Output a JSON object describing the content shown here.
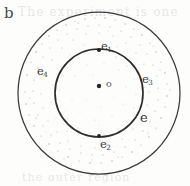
{
  "figure": {
    "panel_letter": "b",
    "caption_ghost_top": "The experiment is one",
    "caption_ghost_bottom": "the outer region",
    "background_color": "#fdfdfc",
    "ink_color": "#3b3b3b",
    "stipple_color": "#8a8a8a"
  },
  "geometry": {
    "center": {
      "x": 99,
      "y": 93
    },
    "outer_circle": {
      "cx": 99,
      "cy": 93,
      "r": 81,
      "label": "outer-circle"
    },
    "inner_circle": {
      "cx": 99,
      "cy": 93,
      "r": 44,
      "label": "inner-circle"
    },
    "axis_line": {
      "x": 99,
      "y1": 12,
      "y2": 174,
      "label": "vertical-axis"
    },
    "dashed_lines": [
      {
        "y": 76,
        "x1": 62,
        "x2": 136,
        "label": "dashed-upper"
      },
      {
        "y": 86,
        "x1": 57,
        "x2": 141,
        "label": "dashed-middle"
      },
      {
        "y": 93,
        "x1": 55,
        "x2": 143,
        "label": "dashed-equator"
      }
    ]
  },
  "labels": {
    "e1": {
      "text": "e",
      "sub": "1",
      "role": "north-pole-point"
    },
    "e2": {
      "text": "e",
      "sub": "2",
      "role": "south-pole-point"
    },
    "e3": {
      "text": "e",
      "sub": "3",
      "role": "east-point"
    },
    "e4": {
      "text": "e",
      "sub": "4",
      "role": "west-point"
    },
    "e": {
      "text": "e",
      "sub": "",
      "role": "inner-sphere-surface"
    },
    "o": {
      "text": "o",
      "sub": "",
      "role": "origin-center"
    }
  },
  "points": [
    {
      "name": "e1",
      "x": 99,
      "y": 50
    },
    {
      "name": "e2",
      "x": 99,
      "y": 136
    },
    {
      "name": "o",
      "x": 99,
      "y": 86
    }
  ]
}
